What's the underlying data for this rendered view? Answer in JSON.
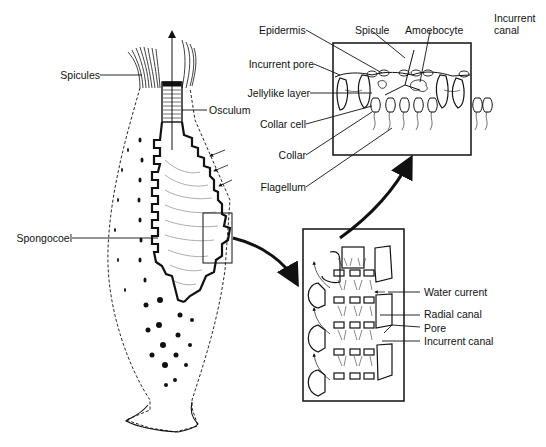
{
  "labels": {
    "spicules": "Spicules",
    "osculum": "Osculum",
    "spongocoel": "Spongocoel",
    "epidermis": "Epidermis",
    "spicule": "Spicule",
    "amoebocyte": "Amoebocyte",
    "incurrent_canal_top_line1": "Incurrent",
    "incurrent_canal_top_line2": "canal",
    "incurrent_pore": "Incurrent pore",
    "jellylike_layer": "Jellylike layer",
    "collar_cell": "Collar cell",
    "collar": "Collar",
    "flagellum": "Flagellum",
    "water_current": "Water current",
    "radial_canal": "Radial canal",
    "pore": "Pore",
    "incurrent_canal": "Incurrent canal"
  },
  "colors": {
    "ink": "#111111",
    "background": "#ffffff"
  }
}
